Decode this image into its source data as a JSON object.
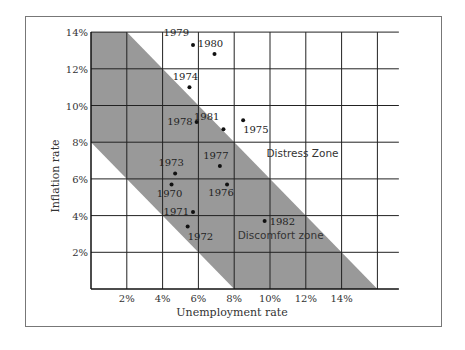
{
  "chart_data": {
    "type": "scatter",
    "title": "",
    "xlabel": "Unemployment rate",
    "ylabel": "Inflation rate",
    "xlim": [
      0,
      17.2
    ],
    "ylim": [
      0,
      14
    ],
    "grid": true,
    "x_ticks": [
      {
        "value": 2,
        "label": "2%"
      },
      {
        "value": 4,
        "label": "4%"
      },
      {
        "value": 6,
        "label": "6%"
      },
      {
        "value": 8,
        "label": "8%"
      },
      {
        "value": 10,
        "label": "10%"
      },
      {
        "value": 12,
        "label": "12%"
      },
      {
        "value": 14,
        "label": "14%"
      }
    ],
    "y_ticks": [
      {
        "value": 2,
        "label": "2%"
      },
      {
        "value": 4,
        "label": "4%"
      },
      {
        "value": 6,
        "label": "6%"
      },
      {
        "value": 8,
        "label": "8%"
      },
      {
        "value": 10,
        "label": "10%"
      },
      {
        "value": 12,
        "label": "12%"
      },
      {
        "value": 14,
        "label": "14%"
      }
    ],
    "x_grid_max": 16,
    "band": {
      "description": "Shaded discomfort band between misery-index lines x+y=8 and x+y=16",
      "polygon": [
        [
          0,
          14
        ],
        [
          2,
          14
        ],
        [
          16,
          0
        ],
        [
          8,
          0
        ],
        [
          0,
          8
        ]
      ],
      "color": "#999999"
    },
    "zones": [
      {
        "label": "Distress Zone",
        "x": 9.8,
        "y": 7.2
      },
      {
        "label": "Discomfort zone",
        "x": 8.2,
        "y": 2.7
      }
    ],
    "points": [
      {
        "year": "1970",
        "x": 4.5,
        "y": 5.7,
        "label_pos": "below"
      },
      {
        "year": "1971",
        "x": 5.7,
        "y": 4.2,
        "label_pos": "left"
      },
      {
        "year": "1972",
        "x": 5.4,
        "y": 3.4,
        "label_pos": "below-right"
      },
      {
        "year": "1973",
        "x": 4.7,
        "y": 6.3,
        "label_pos": "above"
      },
      {
        "year": "1974",
        "x": 5.5,
        "y": 11.0,
        "label_pos": "above"
      },
      {
        "year": "1975",
        "x": 8.5,
        "y": 9.2,
        "label_pos": "below-right"
      },
      {
        "year": "1976",
        "x": 7.6,
        "y": 5.7,
        "label_pos": "below-left"
      },
      {
        "year": "1977",
        "x": 7.2,
        "y": 6.7,
        "label_pos": "above"
      },
      {
        "year": "1978",
        "x": 5.9,
        "y": 9.1,
        "label_pos": "left"
      },
      {
        "year": "1979",
        "x": 5.7,
        "y": 13.3,
        "label_pos": "above-left"
      },
      {
        "year": "1980",
        "x": 6.9,
        "y": 12.8,
        "label_pos": "above"
      },
      {
        "year": "1981",
        "x": 7.4,
        "y": 8.7,
        "label_pos": "above-left"
      },
      {
        "year": "1982",
        "x": 9.7,
        "y": 3.7,
        "label_pos": "right"
      }
    ]
  }
}
